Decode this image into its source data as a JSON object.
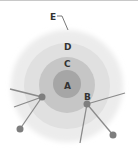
{
  "diagram": {
    "labels": {
      "a": "A",
      "b": "B",
      "c": "C",
      "d": "D",
      "e": "E"
    },
    "colors": {
      "ring_e": "#ececec",
      "ring_d": "#dedede",
      "ring_c": "#c4c4c4",
      "core_a": "#a4a4a4",
      "lines": "#8a8a8a",
      "nodes": "#7e7e7e",
      "label": "#333333"
    }
  }
}
